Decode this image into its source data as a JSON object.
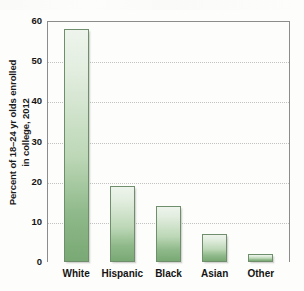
{
  "chart_data": {
    "type": "bar",
    "title": "",
    "xlabel": "",
    "ylabel_line1": "Percent of 18–24 yr olds enrolled",
    "ylabel_line2": "in college, 2012",
    "categories": [
      "White",
      "Hispanic",
      "Black",
      "Asian",
      "Other"
    ],
    "values": [
      58,
      19,
      14,
      7,
      2
    ],
    "ylim": [
      0,
      60
    ],
    "yticks": [
      0,
      10,
      20,
      30,
      40,
      50,
      60
    ],
    "ytick_labels": [
      "0",
      "10",
      "20",
      "30",
      "40",
      "50",
      "60"
    ],
    "grid": true,
    "grid_axis": "y",
    "legend": false,
    "bar_fill_top": "#eef4ec",
    "bar_fill_bottom": "#79a974",
    "bar_edge_color": "#6f8f6c",
    "axis_color": "#8c8c8c",
    "grid_color": "#c2c2c2",
    "background_color": "#fdfdfb",
    "text_color": "#141414"
  }
}
